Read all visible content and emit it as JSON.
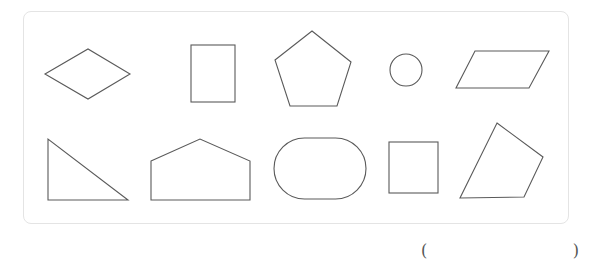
{
  "figure": {
    "panel": {
      "border_color": "#e4e4e4",
      "background": "#ffffff"
    },
    "stroke_color": "#5a5a5a",
    "shapes": [
      {
        "name": "rhombus",
        "row": 1,
        "col": 1
      },
      {
        "name": "rectangle",
        "row": 1,
        "col": 2
      },
      {
        "name": "pentagon",
        "row": 1,
        "col": 3
      },
      {
        "name": "circle",
        "row": 1,
        "col": 4
      },
      {
        "name": "parallelogram",
        "row": 1,
        "col": 5
      },
      {
        "name": "right-triangle",
        "row": 2,
        "col": 1
      },
      {
        "name": "house-pentagon",
        "row": 2,
        "col": 2
      },
      {
        "name": "stadium",
        "row": 2,
        "col": 3
      },
      {
        "name": "square",
        "row": 2,
        "col": 4
      },
      {
        "name": "irregular-quadrilateral",
        "row": 2,
        "col": 5
      }
    ]
  },
  "answer": {
    "open_paren": "(",
    "close_paren": ")",
    "value": ""
  }
}
